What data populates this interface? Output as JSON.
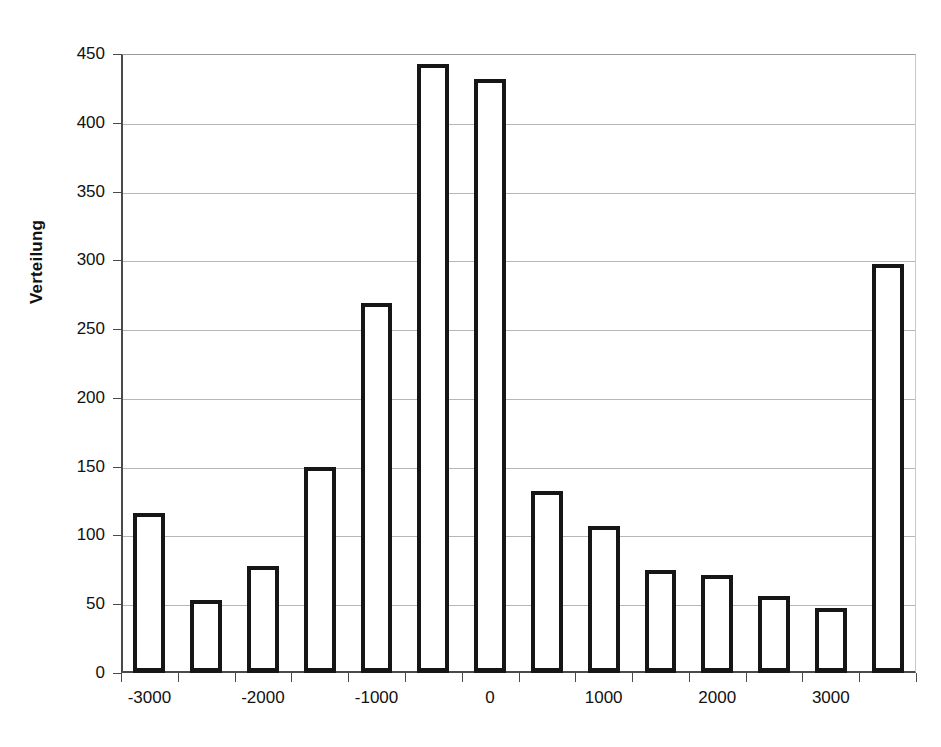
{
  "chart_data": {
    "type": "bar",
    "title": "",
    "subtitle": "",
    "xlabel": "",
    "ylabel": "Verteilung",
    "ylim": [
      0,
      450
    ],
    "xlim": [
      -3250,
      3750
    ],
    "grid": true,
    "legend": null,
    "y_ticks": [
      450,
      400,
      350,
      300,
      250,
      200,
      150,
      100,
      50,
      0
    ],
    "y_tick_labels": [
      "450",
      "400",
      "350",
      "300",
      "250",
      "200",
      "150",
      "100",
      "50",
      "0"
    ],
    "x_ticks": [
      -3000,
      -2000,
      -1000,
      0,
      1000,
      2000,
      3000
    ],
    "x_tick_labels": [
      "-3000",
      "-2000",
      "-1000",
      "0",
      "1000",
      "2000",
      "3000"
    ],
    "bin_width": 500,
    "categories": [
      -3000,
      -2500,
      -2000,
      -1500,
      -1000,
      -500,
      0,
      500,
      1000,
      1500,
      2000,
      2500,
      3000,
      3500
    ],
    "values": [
      116,
      53,
      78,
      150,
      269,
      443,
      432,
      132,
      107,
      75,
      71,
      56,
      47,
      297
    ],
    "bar_style": {
      "fill": "#ffffff",
      "edge": "#161616",
      "edge_width": 4
    },
    "axis_color": "#4a4a4a",
    "grid_color": "#b6b6b6"
  }
}
